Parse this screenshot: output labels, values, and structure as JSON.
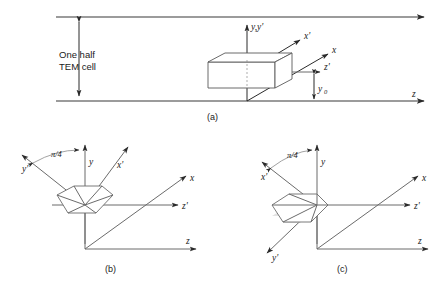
{
  "figure": {
    "panels": [
      {
        "id": "a",
        "caption": "(a)",
        "annotation_lines": [
          "One half",
          "TEM cell"
        ],
        "axis_labels": [
          "y,y'",
          "x'",
          "x",
          "z'",
          "z"
        ],
        "dimension_label": "y",
        "dimension_subscript": "0",
        "object": "rectangular box"
      },
      {
        "id": "b",
        "caption": "(b)",
        "angle_label": "π/4",
        "axis_labels": [
          "y",
          "y'",
          "x'",
          "x",
          "z'",
          "z"
        ],
        "object": "hexagonal cross-section"
      },
      {
        "id": "c",
        "caption": "(c)",
        "angle_label": "π/4",
        "axis_labels": [
          "y",
          "x'",
          "y'",
          "x",
          "z'",
          "z"
        ],
        "object": "hexagonal cross-section"
      }
    ]
  },
  "labels": {
    "one_half": "One half",
    "tem_cell": "TEM cell",
    "y_yprime": "y,y'",
    "x_prime": "x'",
    "x": "x",
    "y": "y",
    "y_prime": "y'",
    "z_prime": "z'",
    "z": "z",
    "y_zero_base": "y",
    "y_zero_sub": "0",
    "pi_over_4": "π/4",
    "cap_a": "(a)",
    "cap_b": "(b)",
    "cap_c": "(c)"
  },
  "colors": {
    "stroke": "#6b6b6b",
    "stroke_dark": "#2a2a2a",
    "text": "#1a1a1a",
    "shade": "#d9d9d9",
    "background": "#ffffff"
  }
}
